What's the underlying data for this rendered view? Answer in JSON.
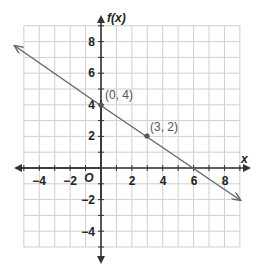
{
  "chart_data": {
    "type": "line",
    "title": "",
    "xlabel": "x",
    "ylabel": "f(x)",
    "xlim": [
      -5,
      9
    ],
    "ylim": [
      -5,
      9
    ],
    "grid": true,
    "x_ticks": [
      -4,
      -2,
      2,
      4,
      6,
      8
    ],
    "y_ticks": [
      8,
      6,
      4,
      2,
      -2,
      -4
    ],
    "x_tick_labels": [
      "−4",
      "−2",
      "2",
      "4",
      "6",
      "8"
    ],
    "y_tick_labels": [
      "8",
      "6",
      "4",
      "2",
      "−2",
      "−4"
    ],
    "origin_label": "O",
    "series": [
      {
        "name": "f(x)",
        "equation": "f(x) = -2/3 x + 4",
        "x": [
          -5.6,
          0,
          3,
          6,
          9
        ],
        "y": [
          7.73,
          4,
          2,
          0,
          -2
        ],
        "arrows_both_ends": true,
        "color": "#666666"
      }
    ],
    "annotations": [
      {
        "label": "(0, 4)",
        "x": 0,
        "y": 4
      },
      {
        "label": "(3, 2)",
        "x": 3,
        "y": 2
      }
    ]
  },
  "colors": {
    "grid": "#cfcfcf",
    "axes": "#333333",
    "line": "#666666",
    "point": "#555555"
  }
}
